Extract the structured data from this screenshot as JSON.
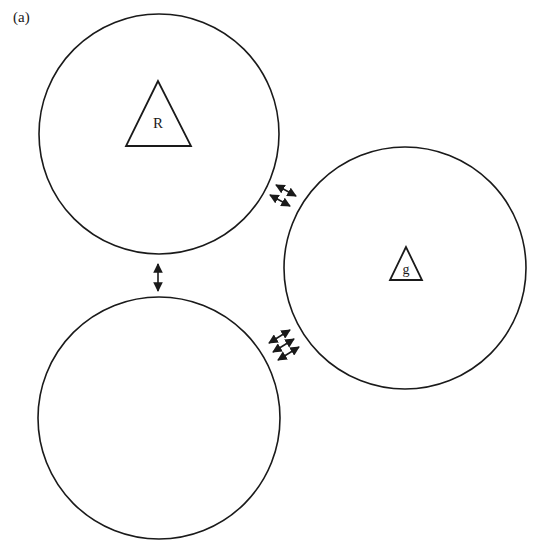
{
  "figure": {
    "panel_label": "(a)",
    "stroke_color": "#1a1a1a",
    "background": "#ffffff"
  },
  "nodes": [
    {
      "id": "top-circle",
      "cx": 159,
      "cy": 134,
      "r": 120,
      "marker": {
        "shape": "triangle",
        "label": "R",
        "apex": [
          158,
          81
        ],
        "base_left": [
          126,
          146
        ],
        "base_right": [
          191,
          146
        ],
        "label_pos": [
          158,
          128
        ],
        "font_size": 15
      }
    },
    {
      "id": "right-circle",
      "cx": 405,
      "cy": 268,
      "r": 121,
      "marker": {
        "shape": "triangle",
        "label": "g",
        "apex": [
          406,
          247
        ],
        "base_left": [
          390,
          280
        ],
        "base_right": [
          422,
          280
        ],
        "label_pos": [
          406,
          274
        ],
        "font_size": 14
      }
    },
    {
      "id": "bottom-circle",
      "cx": 159,
      "cy": 418,
      "r": 121,
      "marker": null
    }
  ],
  "connections": [
    {
      "between": [
        "top-circle",
        "bottom-circle"
      ],
      "count": 1,
      "arrows": [
        {
          "x1": 158,
          "y1": 264,
          "x2": 158,
          "y2": 291
        }
      ]
    },
    {
      "between": [
        "top-circle",
        "right-circle"
      ],
      "count": 2,
      "arrows": [
        {
          "x1": 276,
          "y1": 185,
          "x2": 296,
          "y2": 196
        },
        {
          "x1": 270,
          "y1": 195,
          "x2": 290,
          "y2": 206
        }
      ]
    },
    {
      "between": [
        "bottom-circle",
        "right-circle"
      ],
      "count": 3,
      "arrows": [
        {
          "x1": 269,
          "y1": 343,
          "x2": 290,
          "y2": 330
        },
        {
          "x1": 273,
          "y1": 352,
          "x2": 294,
          "y2": 339
        },
        {
          "x1": 278,
          "y1": 360,
          "x2": 299,
          "y2": 347
        }
      ]
    }
  ]
}
